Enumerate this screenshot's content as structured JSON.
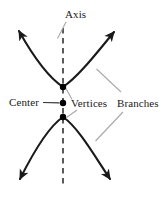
{
  "figure": {
    "background_color": "#ffffff",
    "curve_color": "#1a1a1a",
    "axis_color": "#333333",
    "leader_color": "#a8a8a8",
    "dark_leader_color": "#333333",
    "point_color": "#000000"
  },
  "labels": {
    "axis": "Axis",
    "center": "Center",
    "vertices": "Vertices",
    "branches": "Branches"
  },
  "diagram_data": {
    "type": "diagram",
    "shape": "hyperbola",
    "orientation": "vertical",
    "axis": {
      "style": "dashed",
      "x": 63,
      "y_start": 28,
      "y_end": 186
    },
    "points": [
      {
        "name": "upper-vertex",
        "x": 63,
        "y": 87
      },
      {
        "name": "center",
        "x": 63,
        "y": 103
      },
      {
        "name": "lower-vertex",
        "x": 63,
        "y": 117
      }
    ],
    "branches": [
      {
        "name": "upper-branch",
        "opens": "up",
        "vertex": [
          63,
          87
        ],
        "arrow_tips": [
          [
            16,
            27
          ],
          [
            117,
            28
          ]
        ]
      },
      {
        "name": "lower-branch",
        "opens": "down",
        "vertex": [
          63,
          117
        ],
        "arrow_tips": [
          [
            17,
            183
          ],
          [
            113,
            183
          ]
        ]
      }
    ],
    "leaders": [
      {
        "label": "axis",
        "from": [
          66,
          22
        ],
        "to": [
          58,
          38
        ],
        "color": "light"
      },
      {
        "label": "center",
        "from": [
          44,
          102
        ],
        "to": [
          60,
          103
        ],
        "color": "dark"
      },
      {
        "label": "vertices-upper",
        "from": [
          72,
          100
        ],
        "to": [
          66,
          89
        ],
        "color": "light"
      },
      {
        "label": "vertices-lower",
        "from": [
          76,
          110
        ],
        "to": [
          66,
          117
        ],
        "color": "light"
      },
      {
        "label": "branches-upper",
        "from": [
          120,
          92
        ],
        "to": [
          97,
          70
        ],
        "color": "light"
      },
      {
        "label": "branches-lower",
        "from": [
          122,
          112
        ],
        "to": [
          96,
          141
        ],
        "color": "light"
      }
    ]
  }
}
